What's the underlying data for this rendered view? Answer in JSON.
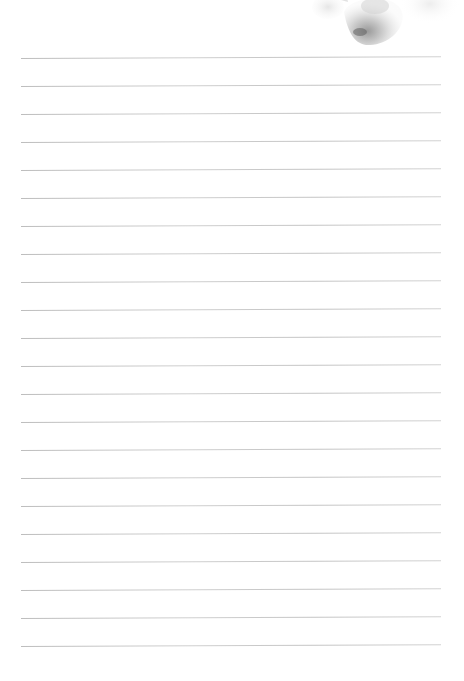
{
  "page": {
    "type": "lined-notepaper",
    "background_color": "#ffffff",
    "line_color": "#c8c8c8",
    "line_count": 22,
    "first_line_y": 58,
    "line_spacing": 28,
    "line_left_x": 21,
    "line_width": 420
  },
  "decoration": {
    "name": "watercolor-flower",
    "position": "top-right",
    "tone": "grayscale"
  }
}
